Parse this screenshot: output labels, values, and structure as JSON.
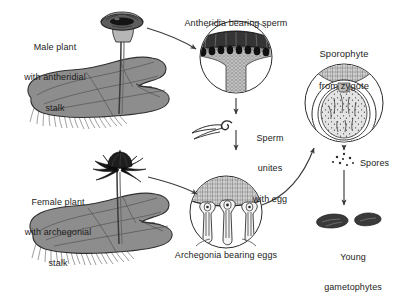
{
  "figure": {
    "type": "biological-life-cycle-diagram",
    "background_color": "#ffffff",
    "ink_color": "#1c1c1c",
    "thallus_fill": "#8a8a8a",
    "receptacle_dark": "#2b2b2b",
    "tissue_light": "#d8d8d8"
  },
  "labels": {
    "male_plant": {
      "line1": "Male plant",
      "line2": "with antheridial",
      "line3": "stalk"
    },
    "female_plant": {
      "line1": "Female plant",
      "line2": "with archegonial",
      "line3": "stalk"
    },
    "antheridia": "Antheridia bearing sperm",
    "archegonia": "Archegonia bearing eggs",
    "sporophyte": {
      "line1": "Sporophyte",
      "line2": "from zygote"
    },
    "fertilization": {
      "line1": "Sperm",
      "line2": "unites",
      "line3": "with egg"
    },
    "spores": "Spores",
    "young_gametophytes": {
      "line1": "Young",
      "line2": "gametophytes"
    }
  },
  "structures": [
    {
      "name": "male-thallus",
      "description": "lobed gray gametophyte thallus with rhizoids"
    },
    {
      "name": "antheridiophore",
      "description": "disc-topped stalk bearing antheridia"
    },
    {
      "name": "female-thallus",
      "description": "lobed gray gametophyte thallus with rhizoids"
    },
    {
      "name": "archegoniophore",
      "description": "finger-rayed umbrella stalk bearing archegonia"
    },
    {
      "name": "antheridia-inset",
      "description": "circular cutaway of antheridial receptacle"
    },
    {
      "name": "archegonia-inset",
      "description": "circular cutaway with three flask-shaped archegonia"
    },
    {
      "name": "sperm",
      "description": "coiled biflagellate swimming sperm"
    },
    {
      "name": "sporophyte-inset",
      "description": "capsule of spores enclosed by calyptra"
    },
    {
      "name": "spore-cluster",
      "description": "scattered released spores"
    },
    {
      "name": "young-gametophytes",
      "description": "two small dark juvenile thalli"
    }
  ],
  "arrows": [
    {
      "name": "male-to-antheridia",
      "from": "antheridiophore",
      "to": "antheridia-inset"
    },
    {
      "name": "antheridia-to-sperm",
      "from": "antheridia-inset",
      "to": "sperm"
    },
    {
      "name": "sperm-to-archegonia",
      "from": "sperm",
      "to": "archegonia-inset"
    },
    {
      "name": "female-to-archegonia",
      "from": "archegoniophore",
      "to": "archegonia-inset"
    },
    {
      "name": "archegonia-to-sporophyte",
      "from": "archegonia-inset",
      "to": "sporophyte-inset"
    },
    {
      "name": "sporophyte-to-spores",
      "from": "sporophyte-inset",
      "to": "spore-cluster"
    },
    {
      "name": "spores-to-gametophytes",
      "from": "spore-cluster",
      "to": "young-gametophytes"
    }
  ]
}
